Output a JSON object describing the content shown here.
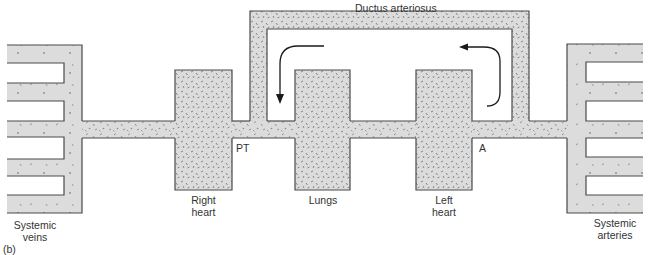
{
  "figure": {
    "panel_label": "(b)"
  },
  "colors": {
    "fill": "#dcdcdc",
    "outline": "#4a4a4a",
    "speckle": "#8a8a8a",
    "arrow": "#1a1a1a",
    "text": "#333333"
  },
  "labels": {
    "systemic_veins": "Systemic\nveins",
    "right_heart": "Right\nheart",
    "lungs": "Lungs",
    "left_heart": "Left\nheart",
    "systemic_arteries": "Systemic\narteries",
    "ductus_arteriosus": "Ductus arteriosus",
    "pt": "PT",
    "a": "A"
  },
  "components": [
    {
      "id": "systemic-veins",
      "label": "Systemic veins"
    },
    {
      "id": "right-heart",
      "label": "Right heart"
    },
    {
      "id": "pulmonary-trunk",
      "label": "PT"
    },
    {
      "id": "lungs",
      "label": "Lungs"
    },
    {
      "id": "left-heart",
      "label": "Left heart"
    },
    {
      "id": "aorta",
      "label": "A"
    },
    {
      "id": "ductus-arteriosus",
      "label": "Ductus arteriosus"
    },
    {
      "id": "systemic-arteries",
      "label": "Systemic arteries"
    }
  ],
  "arrows": [
    {
      "id": "ductus-flow-left",
      "direction": "down",
      "description": "Flow from ductus down toward PT"
    },
    {
      "id": "ductus-flow-right",
      "direction": "up-left",
      "description": "Flow from aorta side up into ductus"
    }
  ]
}
